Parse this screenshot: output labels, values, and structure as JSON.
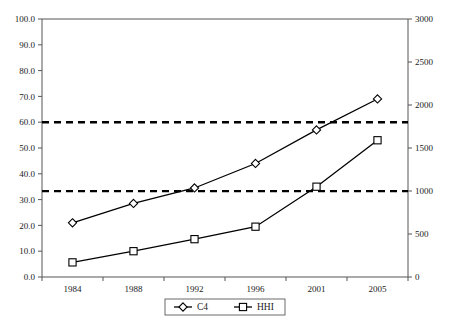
{
  "chart_data": {
    "type": "line",
    "title": "",
    "subtitle": "",
    "xlabel": "",
    "ylabel": "",
    "y2label": "",
    "categories": [
      "1984",
      "1988",
      "1992",
      "1996",
      "2001",
      "2005"
    ],
    "grid": false,
    "legend_position": "bottom",
    "axes": {
      "left": {
        "ticks": [
          "0.0",
          "10.0",
          "20.0",
          "30.0",
          "40.0",
          "50.0",
          "60.0",
          "70.0",
          "80.0",
          "90.0",
          "100.0"
        ],
        "min": 0,
        "max": 100,
        "step": 10
      },
      "right": {
        "ticks": [
          "0",
          "500",
          "1000",
          "1500",
          "2000",
          "2500",
          "3000"
        ],
        "min": 0,
        "max": 3000,
        "step": 500
      }
    },
    "series": [
      {
        "name": "C4",
        "axis": "left",
        "marker": "diamond",
        "values": [
          21.0,
          28.5,
          34.5,
          44.0,
          57.0,
          69.0
        ]
      },
      {
        "name": "HHI",
        "axis": "right",
        "marker": "square",
        "values": [
          170,
          300,
          440,
          585,
          1050,
          1590
        ]
      }
    ],
    "reference_lines": [
      {
        "name": "upper-threshold",
        "axis": "left",
        "value": 60.0,
        "right_axis_value": 1800,
        "style": "dashed"
      },
      {
        "name": "lower-threshold",
        "axis": "left",
        "value": 33.3,
        "right_axis_value": 1000,
        "style": "dashed"
      }
    ],
    "legend": [
      {
        "label": "C4",
        "marker": "diamond"
      },
      {
        "label": "HHI",
        "marker": "square"
      }
    ],
    "colors": {
      "series": "#000000",
      "reference_line": "#000000",
      "axis": "#555555",
      "background": "#ffffff"
    }
  }
}
